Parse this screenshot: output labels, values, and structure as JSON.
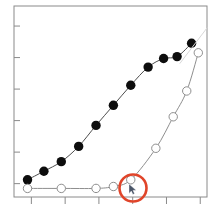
{
  "figure": {
    "background_color": "#ffffff",
    "frame_color": "#8a8a8a",
    "width": 218,
    "height": 209
  },
  "annotation": {
    "name": "red-circle-highlight",
    "color": "#e0452a",
    "cx": 133,
    "cy": 188,
    "r": 13.5,
    "stroke_width": 2.6
  },
  "cursor": {
    "name": "mouse-pointer",
    "x": 129,
    "y": 184,
    "color": "#4a5568"
  },
  "chart_data": {
    "type": "scatter",
    "title": "",
    "subtitle": "",
    "xlabel": "",
    "ylabel": "",
    "xlim": [
      0,
      1
    ],
    "ylim": [
      0,
      1
    ],
    "grid": false,
    "legend": "none",
    "xticks": [
      0.09,
      0.265,
      0.44,
      0.615,
      0.79,
      0.965
    ],
    "yticks": [
      0.07,
      0.235,
      0.4,
      0.565,
      0.73,
      0.895
    ],
    "xticklabels": [
      "",
      "",
      "",
      "",
      "",
      ""
    ],
    "yticklabels": [
      "",
      "",
      "",
      "",
      "",
      ""
    ],
    "series": [
      {
        "name": "filled-circles",
        "marker": "filled-circle",
        "marker_color": "#0d0d0d",
        "marker_size": 9.4,
        "line_color": "#4d4d4d",
        "line_width": 1.0,
        "x": [
          0.07,
          0.155,
          0.245,
          0.335,
          0.425,
          0.515,
          0.605,
          0.695,
          0.775,
          0.845,
          0.92
        ],
        "y": [
          0.09,
          0.135,
          0.185,
          0.265,
          0.375,
          0.48,
          0.585,
          0.68,
          0.725,
          0.735,
          0.805
        ]
      },
      {
        "name": "open-circles",
        "marker": "open-circle",
        "marker_color": "#ffffff",
        "marker_edge_color": "#8e8e8e",
        "marker_size": 8.4,
        "line_color": "#8e8e8e",
        "line_width": 1.0,
        "x": [
          0.07,
          0.245,
          0.425,
          0.515,
          0.605,
          0.735,
          0.825,
          0.895,
          0.955
        ],
        "y": [
          0.045,
          0.045,
          0.045,
          0.055,
          0.09,
          0.255,
          0.42,
          0.555,
          0.755
        ]
      },
      {
        "name": "faint-diagonal-guide",
        "marker": "none",
        "line_color": "#d8d8d8",
        "line_width": 1.0,
        "x": [
          0.86,
          1.0
        ],
        "y": [
          0.7,
          0.885
        ]
      }
    ]
  }
}
